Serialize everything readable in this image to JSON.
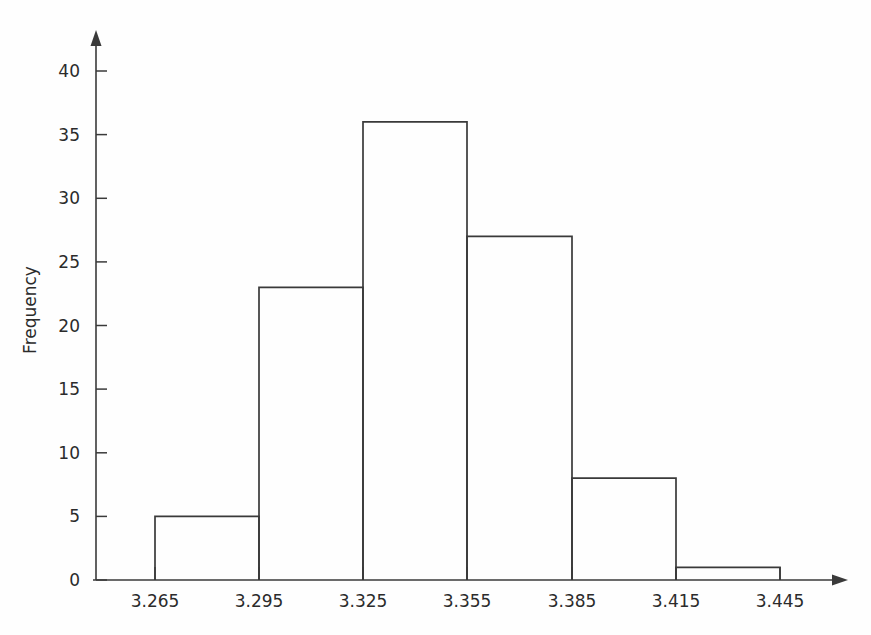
{
  "chart_data": {
    "type": "bar",
    "title": "",
    "subtitle": "",
    "xlabel": "",
    "ylabel": "Frequency",
    "grid": false,
    "legend": false,
    "legend_position": "none",
    "bin_edges": [
      3.265,
      3.295,
      3.325,
      3.355,
      3.385,
      3.415,
      3.445
    ],
    "categories": [
      "3.265-3.295",
      "3.295-3.325",
      "3.325-3.355",
      "3.355-3.385",
      "3.385-3.415",
      "3.415-3.445"
    ],
    "values": [
      5,
      23,
      36,
      27,
      8,
      1
    ],
    "xtick_labels": [
      "3.265",
      "3.295",
      "3.325",
      "3.355",
      "3.385",
      "3.415",
      "3.445"
    ],
    "xtick_values": [
      3.265,
      3.295,
      3.325,
      3.355,
      3.385,
      3.415,
      3.445
    ],
    "ytick_labels": [
      "0",
      "5",
      "10",
      "15",
      "20",
      "25",
      "30",
      "35",
      "40"
    ],
    "ytick_values": [
      0,
      5,
      10,
      15,
      20,
      25,
      30,
      35,
      40
    ],
    "ylim": [
      0,
      44
    ],
    "xlim": [
      3.2335,
      3.4835
    ],
    "bar_fill": "#ffffff",
    "bar_stroke": "#3a3a3a",
    "axis_color": "#3a3a3a",
    "background": "#fefefe",
    "text_color": "#2b2b2b"
  },
  "labels": {
    "y_axis_title": "Frequency",
    "x_0": "3.265",
    "x_1": "3.295",
    "x_2": "3.325",
    "x_3": "3.355",
    "x_4": "3.385",
    "x_5": "3.415",
    "x_6": "3.445",
    "y_0": "0",
    "y_1": "5",
    "y_2": "10",
    "y_3": "15",
    "y_4": "20",
    "y_5": "25",
    "y_6": "30",
    "y_7": "35",
    "y_8": "40"
  }
}
